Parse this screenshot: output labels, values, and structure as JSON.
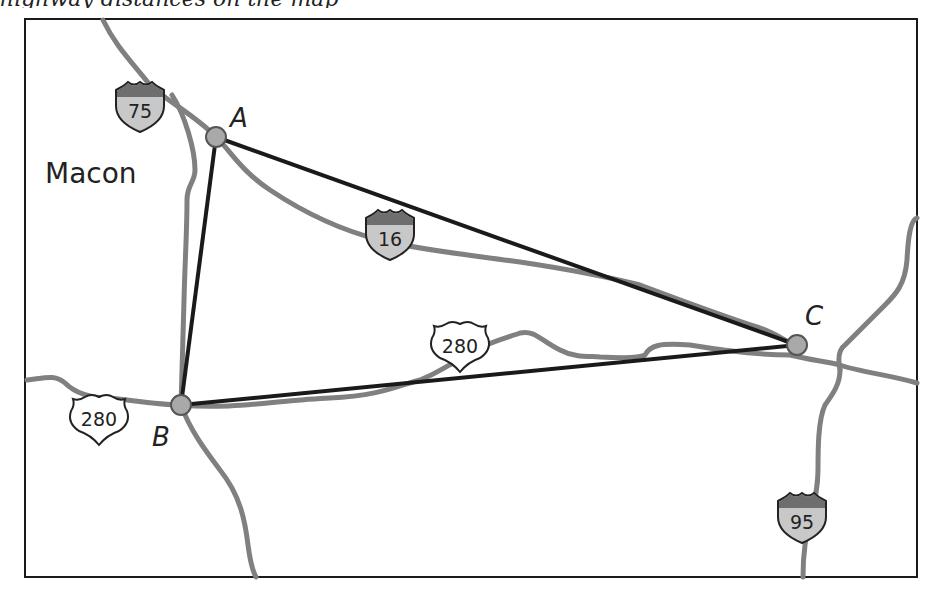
{
  "header_cutoff_text": "highway distances on the map",
  "map": {
    "city": "Macon",
    "points": [
      {
        "id": "A",
        "label": "A"
      },
      {
        "id": "B",
        "label": "B"
      },
      {
        "id": "C",
        "label": "C"
      }
    ],
    "triangle_edges": [
      "A-B",
      "A-C",
      "B-C"
    ],
    "highway_shields": [
      {
        "type": "interstate",
        "number": "75"
      },
      {
        "type": "interstate",
        "number": "16"
      },
      {
        "type": "us-route",
        "number": "280"
      },
      {
        "type": "us-route",
        "number": "280"
      },
      {
        "type": "interstate",
        "number": "95"
      }
    ],
    "colors": {
      "road": "#808080",
      "triangle": "#1a1a1a",
      "point_fill": "#a9a9a9",
      "interstate_top": "#6e6e6e",
      "interstate_bottom": "#c8c8c8",
      "border": "#1a1a1a"
    }
  }
}
